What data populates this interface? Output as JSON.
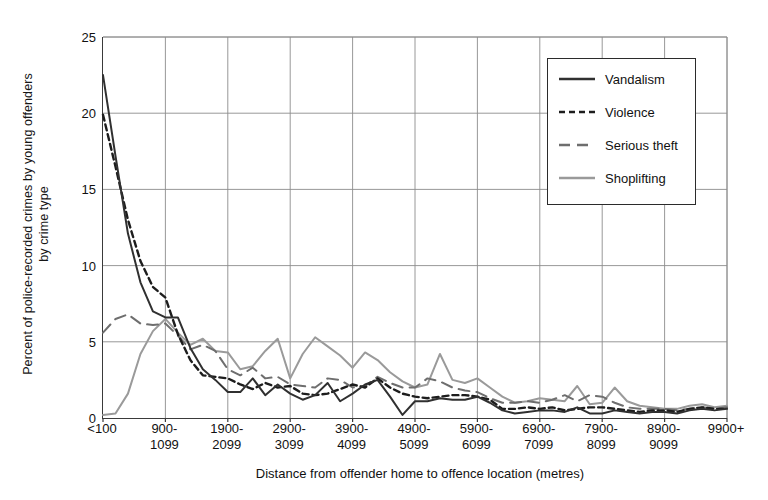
{
  "chart_data": {
    "type": "line",
    "title": "",
    "xlabel": "Distance from offender home to offence location (metres)",
    "ylabel": "Percent of police-recorded crimes by young offenders by crime type",
    "ylabel_lines": [
      "Percent of police-recorded crimes by young offenders",
      "by crime type"
    ],
    "ylim": [
      0,
      25
    ],
    "yticks": [
      0,
      5,
      10,
      15,
      20,
      25
    ],
    "grid": true,
    "legend_position": "top-right",
    "xlim": [
      0,
      50
    ],
    "xtick_positions": [
      0,
      5,
      10,
      15,
      20,
      25,
      30,
      35,
      40,
      45,
      50
    ],
    "categories": [
      "<100",
      "100-299",
      "300-499",
      "500-699",
      "700-899",
      "900-1099",
      "1100-1299",
      "1300-1499",
      "1500-1699",
      "1700-1899",
      "1900-2099",
      "2100-2299",
      "2300-2499",
      "2500-2699",
      "2700-2899",
      "2900-3099",
      "3100-3299",
      "3300-3499",
      "3500-3699",
      "3700-3899",
      "3900-4099",
      "4100-4299",
      "4300-4499",
      "4500-4699",
      "4700-4899",
      "4900-5099",
      "5100-5299",
      "5300-5499",
      "5500-5699",
      "5700-5899",
      "5900-6099",
      "6100-6299",
      "6300-6499",
      "6500-6699",
      "6700-6899",
      "6900-7099",
      "7100-7299",
      "7300-7499",
      "7500-7699",
      "7700-7899",
      "7900-8099",
      "8100-8299",
      "8300-8499",
      "8500-8699",
      "8700-8899",
      "8900-9099",
      "9100-9299",
      "9300-9499",
      "9500-9699",
      "9700-9899",
      "9900+"
    ],
    "xtick_labels": [
      {
        "line1": "<100",
        "line2": ""
      },
      {
        "line1": "900-",
        "line2": "1099"
      },
      {
        "line1": "1900-",
        "line2": "2099"
      },
      {
        "line1": "2900-",
        "line2": "3099"
      },
      {
        "line1": "3900-",
        "line2": "4099"
      },
      {
        "line1": "4900-",
        "line2": "5099"
      },
      {
        "line1": "5900-",
        "line2": "6099"
      },
      {
        "line1": "6900-",
        "line2": "7099"
      },
      {
        "line1": "7900-",
        "line2": "8099"
      },
      {
        "line1": "8900-",
        "line2": "9099"
      },
      {
        "line1": "9900+",
        "line2": ""
      }
    ],
    "series": [
      {
        "name": "Vandalism",
        "color": "#303030",
        "dash": "none",
        "width": 2.0,
        "values": [
          22.5,
          17.2,
          12.1,
          8.9,
          7.0,
          6.6,
          6.6,
          4.6,
          3.2,
          2.5,
          1.7,
          1.7,
          2.6,
          1.5,
          2.2,
          1.6,
          1.2,
          1.5,
          2.3,
          1.1,
          1.6,
          2.2,
          2.5,
          1.4,
          0.2,
          1.1,
          1.1,
          1.3,
          1.2,
          1.2,
          1.4,
          1.0,
          0.5,
          0.3,
          0.4,
          0.5,
          0.5,
          0.4,
          0.7,
          0.3,
          0.3,
          0.5,
          0.4,
          0.3,
          0.4,
          0.4,
          0.3,
          0.5,
          0.6,
          0.5,
          0.6
        ]
      },
      {
        "name": "Violence",
        "color": "#1d1d1d",
        "dash": "6,4",
        "width": 2.4,
        "values": [
          19.9,
          16.5,
          13.0,
          10.3,
          8.6,
          7.9,
          5.5,
          3.8,
          2.8,
          2.7,
          2.6,
          2.2,
          1.9,
          2.3,
          2.0,
          2.1,
          1.6,
          1.5,
          1.6,
          1.9,
          2.2,
          2.0,
          2.6,
          2.0,
          1.6,
          1.4,
          1.3,
          1.4,
          1.5,
          1.5,
          1.4,
          1.2,
          0.6,
          0.6,
          0.7,
          0.6,
          0.7,
          0.5,
          0.6,
          0.7,
          0.7,
          0.6,
          0.5,
          0.4,
          0.5,
          0.5,
          0.4,
          0.6,
          0.7,
          0.6,
          0.6
        ]
      },
      {
        "name": "Serious theft",
        "color": "#6e6e6e",
        "dash": "11,7",
        "width": 2.0,
        "values": [
          5.6,
          6.5,
          6.8,
          6.2,
          6.1,
          6.2,
          5.4,
          4.5,
          4.8,
          4.4,
          3.2,
          2.8,
          3.3,
          2.6,
          2.7,
          2.2,
          2.1,
          2.0,
          2.6,
          2.5,
          2.0,
          2.1,
          2.7,
          2.3,
          2.0,
          2.0,
          2.6,
          2.4,
          2.0,
          1.8,
          1.7,
          1.3,
          1.0,
          1.0,
          1.1,
          1.0,
          1.2,
          1.5,
          1.1,
          1.5,
          1.4,
          1.0,
          0.7,
          0.6,
          0.6,
          0.6,
          0.5,
          0.6,
          0.7,
          0.6,
          0.7
        ]
      },
      {
        "name": "Shoplifting",
        "color": "#9a9a9a",
        "dash": "none",
        "width": 2.0,
        "values": [
          0.2,
          0.3,
          1.6,
          4.2,
          5.7,
          6.5,
          5.6,
          4.8,
          5.2,
          4.4,
          4.3,
          3.2,
          3.4,
          4.4,
          5.2,
          2.6,
          4.2,
          5.3,
          4.7,
          4.1,
          3.3,
          4.3,
          3.8,
          3.0,
          2.4,
          2.0,
          2.2,
          4.2,
          2.5,
          2.3,
          2.6,
          2.0,
          1.4,
          1.0,
          1.1,
          1.3,
          1.2,
          1.1,
          2.1,
          0.9,
          1.0,
          2.0,
          1.1,
          0.8,
          0.7,
          0.6,
          0.6,
          0.8,
          0.9,
          0.7,
          0.8
        ]
      }
    ]
  },
  "legend": {
    "items": [
      {
        "label": "Vandalism"
      },
      {
        "label": "Violence"
      },
      {
        "label": "Serious theft"
      },
      {
        "label": "Shoplifting"
      }
    ]
  }
}
